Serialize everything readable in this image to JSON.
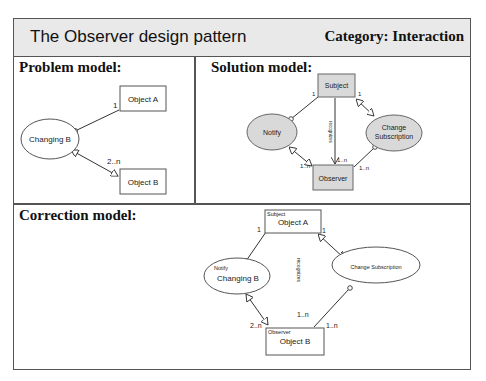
{
  "header": {
    "title": "The Observer design pattern",
    "category": "Category: Interaction",
    "background": "#e9e9e9"
  },
  "problem_model": {
    "label": "Problem model:",
    "objects": [
      {
        "name": "Object A"
      },
      {
        "name": "Object B"
      }
    ],
    "use_cases": [
      {
        "name": "Changing B"
      }
    ],
    "multiplicities": [
      "1",
      "2..n"
    ]
  },
  "solution_model": {
    "label": "Solution model:",
    "objects": [
      {
        "name": "Subject"
      },
      {
        "name": "Observer"
      }
    ],
    "use_cases": [
      {
        "name": "Notify"
      },
      {
        "name_line1": "Change",
        "name_line2": "Subscription"
      }
    ],
    "relation_label": "recognizes",
    "multiplicities": [
      "1",
      "1",
      "1..n",
      "1..n",
      "1..n"
    ],
    "fill_color": "#d9d9d9"
  },
  "correction_model": {
    "label": "Correction model:",
    "objects": [
      {
        "role": "Subject",
        "name": "Object A"
      },
      {
        "role": "Observer",
        "name": "Object B"
      }
    ],
    "use_cases": [
      {
        "role": "Notify",
        "name": "Changing B"
      },
      {
        "name": "Change Subscription"
      }
    ],
    "relation_label": "recognizes",
    "multiplicities": [
      "1",
      "1",
      "2..n",
      "1..n",
      "1..n"
    ]
  }
}
